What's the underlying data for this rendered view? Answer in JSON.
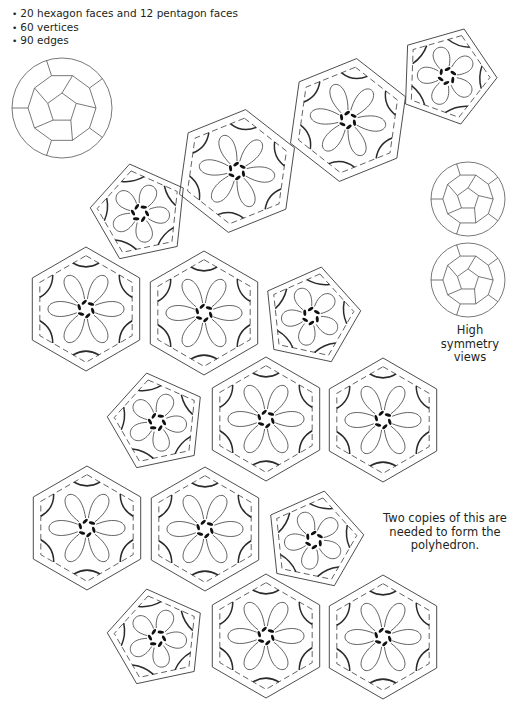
{
  "facts": [
    "20 hexagon faces and 12 pentagon faces",
    "60 vertices",
    "90 edges"
  ],
  "captions": {
    "symmetry_views": "High symmetry views",
    "copies_note": "Two copies of this are needed to form the polyhedron."
  },
  "polyhedron": {
    "name": "truncated icosahedron",
    "hexagon_faces": 20,
    "pentagon_faces": 12,
    "vertices": 60,
    "edges": 90
  },
  "colors": {
    "line": "#3a3a3a",
    "stamen": "#111111",
    "background": "#ffffff"
  },
  "net_faces": [
    {
      "type": "pentagon",
      "cx": 447,
      "cy": 76,
      "r": 50,
      "rot": 20
    },
    {
      "type": "hexagon",
      "cx": 348,
      "cy": 120,
      "r": 62,
      "rot": 8
    },
    {
      "type": "hexagon",
      "cx": 237,
      "cy": 171,
      "r": 62,
      "rot": 8
    },
    {
      "type": "pentagon",
      "cx": 140,
      "cy": 213,
      "r": 50,
      "rot": -12
    },
    {
      "type": "hexagon",
      "cx": 86,
      "cy": 309,
      "r": 62,
      "rot": 0
    },
    {
      "type": "hexagon",
      "cx": 204,
      "cy": 313,
      "r": 62,
      "rot": 0
    },
    {
      "type": "pentagon",
      "cx": 311,
      "cy": 316,
      "r": 50,
      "rot": 12
    },
    {
      "type": "pentagon",
      "cx": 157,
      "cy": 422,
      "r": 50,
      "rot": -12
    },
    {
      "type": "hexagon",
      "cx": 266,
      "cy": 419,
      "r": 62,
      "rot": 0
    },
    {
      "type": "hexagon",
      "cx": 383,
      "cy": 420,
      "r": 62,
      "rot": 0
    },
    {
      "type": "hexagon",
      "cx": 87,
      "cy": 528,
      "r": 62,
      "rot": 0
    },
    {
      "type": "hexagon",
      "cx": 205,
      "cy": 529,
      "r": 62,
      "rot": 0
    },
    {
      "type": "pentagon",
      "cx": 314,
      "cy": 540,
      "r": 50,
      "rot": 12
    },
    {
      "type": "pentagon",
      "cx": 157,
      "cy": 638,
      "r": 50,
      "rot": -12
    },
    {
      "type": "hexagon",
      "cx": 266,
      "cy": 636,
      "r": 62,
      "rot": 0
    },
    {
      "type": "hexagon",
      "cx": 383,
      "cy": 637,
      "r": 62,
      "rot": 0
    }
  ],
  "balls": [
    {
      "name": "perspective-view",
      "cx": 62,
      "cy": 108,
      "r": 50
    },
    {
      "name": "symmetry-view-top",
      "cx": 468,
      "cy": 199,
      "r": 37
    },
    {
      "name": "symmetry-view-bottom",
      "cx": 468,
      "cy": 280,
      "r": 37
    }
  ]
}
